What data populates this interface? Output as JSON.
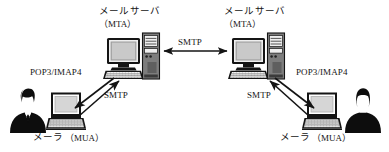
{
  "diagram": {
    "background_color": "#ffffff",
    "stroke_color": "#141414",
    "width": 389,
    "height": 152,
    "nodes": [
      {
        "id": "left-sender-person",
        "icon": "person-male-silhouette-icon",
        "label": "",
        "x": 8,
        "y": 86
      },
      {
        "id": "left-mua",
        "icon": "laptop-icon",
        "label": "メーラ（MUA）",
        "label_main": "メーラ",
        "label_paren": "（MUA）",
        "x": 48,
        "y": 92
      },
      {
        "id": "left-mta",
        "icon": "desktop-server-icon",
        "label_main": "メールサーバ",
        "label_paren": "（MTA）",
        "x": 106,
        "y": 34
      },
      {
        "id": "right-mta",
        "icon": "desktop-server-icon",
        "label_main": "メールサーバ",
        "label_paren": "（MTA）",
        "x": 231,
        "y": 34
      },
      {
        "id": "right-mua",
        "icon": "laptop-icon",
        "label_main": "メーラ",
        "label_paren": "（MUA）",
        "x": 304,
        "y": 92
      },
      {
        "id": "right-recipient-person",
        "icon": "person-female-silhouette-icon",
        "label": "",
        "x": 345,
        "y": 86
      }
    ],
    "edges": [
      {
        "id": "mta-to-mta",
        "label": "SMTP",
        "from": "left-mta",
        "to": "right-mta",
        "arrow": "double"
      },
      {
        "id": "left-mua-to-mta",
        "label": "SMTP",
        "from": "left-mua",
        "to": "left-mta",
        "arrow": "single"
      },
      {
        "id": "left-mta-to-mua",
        "label": "POP3/IMAP4",
        "from": "left-mta",
        "to": "left-mua",
        "arrow": "single"
      },
      {
        "id": "right-mua-to-mta",
        "label": "SMTP",
        "from": "right-mua",
        "to": "right-mta",
        "arrow": "single"
      },
      {
        "id": "right-mta-to-mua",
        "label": "POP3/IMAP4",
        "from": "right-mta",
        "to": "right-mua",
        "arrow": "single"
      }
    ],
    "labels": {
      "left_server_title": "メールサーバ",
      "left_server_sub": "（MTA）",
      "right_server_title": "メールサーバ",
      "right_server_sub": "（MTA）",
      "center_smtp": "SMTP",
      "left_pop3": "POP3/IMAP4",
      "left_smtp": "SMTP",
      "right_pop3": "POP3/IMAP4",
      "right_smtp": "SMTP",
      "left_mua_title": "メーラ",
      "left_mua_sub": "（MUA）",
      "right_mua_title": "メーラ",
      "right_mua_sub": "（MUA）"
    }
  }
}
